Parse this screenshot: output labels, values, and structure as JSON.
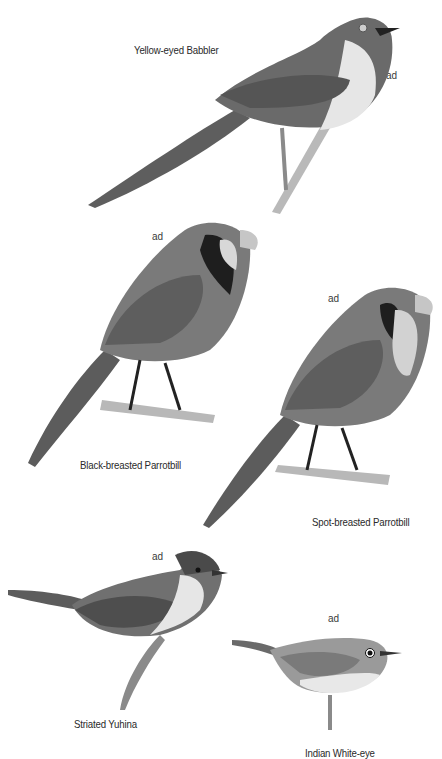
{
  "plate": {
    "species": [
      {
        "name": "Yellow-eyed Babbler",
        "age": "ad"
      },
      {
        "name": "Black-breasted Parrotbill",
        "age": "ad"
      },
      {
        "name": "Spot-breasted Parrotbill",
        "age": "ad"
      },
      {
        "name": "Striated Yuhina",
        "age": "ad"
      },
      {
        "name": "Indian White-eye",
        "age": "ad"
      }
    ]
  }
}
